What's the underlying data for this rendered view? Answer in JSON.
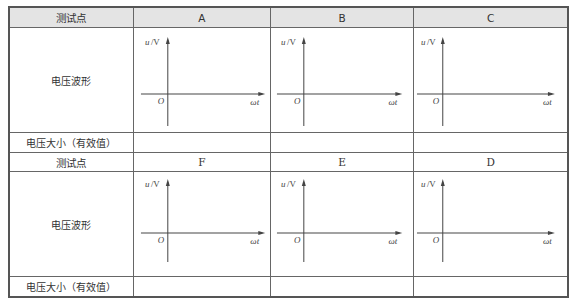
{
  "table": {
    "header_row_1": {
      "label": "测试点",
      "points": [
        "A",
        "B",
        "C"
      ]
    },
    "waveform_row_label": "电压波形",
    "magnitude_row_label": "电压大小（有效值）",
    "header_row_2": {
      "label": "测试点",
      "points": [
        "F",
        "E",
        "D"
      ]
    },
    "magnitude_values_row_1": [
      "",
      "",
      ""
    ],
    "magnitude_values_row_2": [
      "",
      "",
      ""
    ]
  },
  "axes": {
    "y_label_var": "u",
    "y_label_unit": "/V",
    "x_label": "ωt",
    "origin_label": "O"
  },
  "colors": {
    "header_bg": "#e4e4e4",
    "border": "#555555",
    "axis": "#444444"
  }
}
